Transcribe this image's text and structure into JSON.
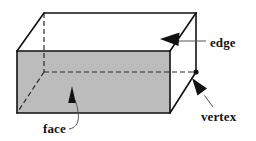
{
  "figure": {
    "type": "geometry-diagram",
    "background_color": "#ffffff",
    "solid": {
      "name": "rectangular-prism",
      "front_face_fill": "#bcbcbc",
      "outline_color": "#111111",
      "hidden_edge_color": "#2a2a2a",
      "outline_width": 1.6,
      "hidden_edge_width": 1.2,
      "hidden_edge_dash": "5,3",
      "vertices": {
        "front_top_left": [
          17,
          51
        ],
        "front_top_right": [
          170,
          51
        ],
        "front_bottom_left": [
          17,
          113
        ],
        "front_bottom_right": [
          170,
          113
        ],
        "back_top_left": [
          44,
          13
        ],
        "back_top_right": [
          196,
          13
        ],
        "back_bottom_left": [
          44,
          72
        ],
        "back_bottom_right": [
          196,
          72
        ]
      },
      "vertex_dot": {
        "name": "marked-vertex",
        "cx": 196,
        "cy": 72,
        "r": 2.6,
        "color": "#111111"
      }
    },
    "labels": [
      {
        "id": "face",
        "text": "face",
        "x": 43,
        "y": 133,
        "anchor": "start",
        "leader": {
          "path": "M 69 129 C 82 127 79 111 75 100",
          "color": "#555555",
          "width": 1.0
        },
        "arrow": {
          "tip": [
            72,
            86
          ],
          "base_left": [
            68,
            103
          ],
          "base_right": [
            76,
            103
          ],
          "color": "#111111"
        }
      },
      {
        "id": "edge",
        "text": "edge",
        "x": 210,
        "y": 47,
        "anchor": "start",
        "leader": {
          "path": "M 206 41 L 177 41",
          "color": "#555555",
          "width": 1.0
        },
        "arrow": {
          "tip": [
            160,
            39
          ],
          "base_left": [
            179,
            33
          ],
          "base_right": [
            178,
            46
          ],
          "color": "#111111"
        }
      },
      {
        "id": "vertex",
        "text": "vertex",
        "x": 201,
        "y": 121,
        "anchor": "start",
        "leader": {
          "path": "M 213 107 L 204 95",
          "color": "#555555",
          "width": 1.0
        },
        "arrow": {
          "tip": [
            192,
            78
          ],
          "base_left": [
            197,
            95
          ],
          "base_right": [
            207,
            89
          ],
          "color": "#111111"
        }
      }
    ]
  }
}
